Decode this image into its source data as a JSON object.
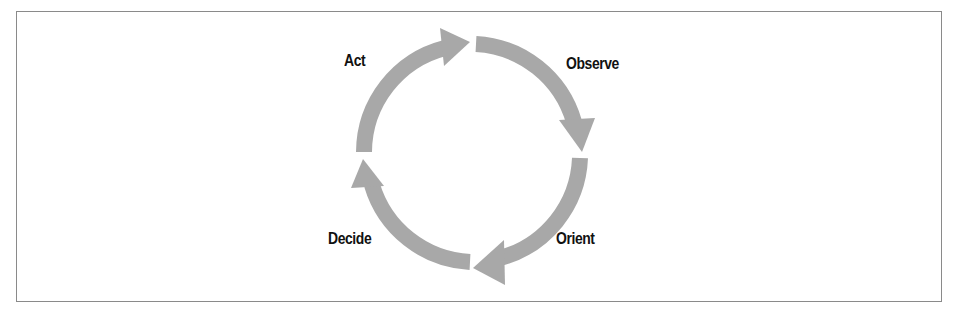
{
  "diagram": {
    "type": "cycle",
    "title": "",
    "arrow_color": "#a8a8a8",
    "text_color": "#111111",
    "border_color": "#8a8a8a",
    "direction": "clockwise",
    "stages": [
      {
        "label": "Observe"
      },
      {
        "label": "Orient"
      },
      {
        "label": "Decide"
      },
      {
        "label": "Act"
      }
    ]
  }
}
